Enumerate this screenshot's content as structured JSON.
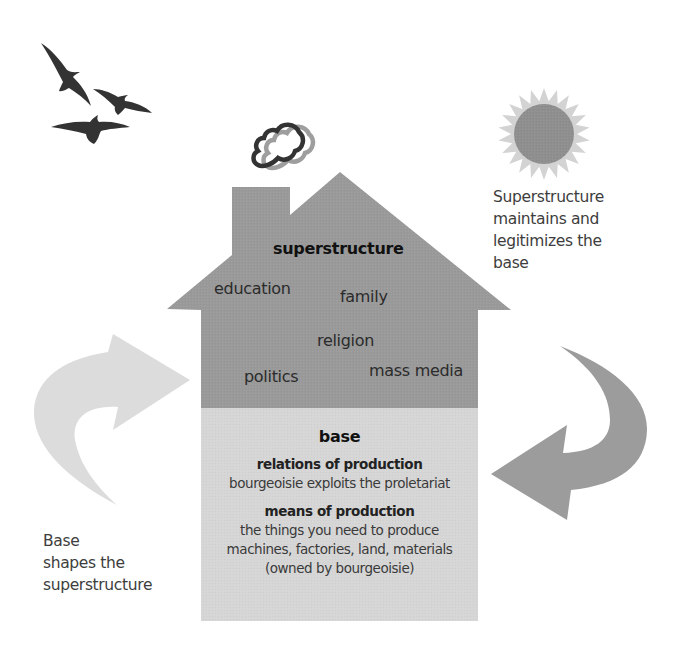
{
  "colors": {
    "superstructure_fill": "#9a9a9a",
    "base_fill": "#d6d6d6",
    "left_arrow_fill": "#dcdcdc",
    "right_arrow_fill": "#9c9c9c",
    "sun_disk": "#8f8f8f",
    "sun_rays": "#d3d3d3",
    "bird_fill": "#333333",
    "smoke_dark": "#333333",
    "smoke_light": "#9a9a9a"
  },
  "icons": {
    "birds": "birds-icon",
    "sun": "sun-icon",
    "smoke": "chimney-smoke-icon",
    "left_arrow": "curved-arrow-up-right-icon",
    "right_arrow": "curved-arrow-down-left-icon"
  },
  "superstructure": {
    "title": "superstructure",
    "institutions": {
      "education": "education",
      "family": "family",
      "religion": "religion",
      "politics": "politics",
      "mass_media": "mass media"
    }
  },
  "base": {
    "title": "base",
    "relations": {
      "heading": "relations of production",
      "description": "bourgeoisie exploits the proletariat"
    },
    "means": {
      "heading": "means of production",
      "lines": [
        "the things you need to produce",
        "machines, factories, land, materials",
        "(owned by bourgeoisie)"
      ]
    }
  },
  "annotations": {
    "right": [
      "Superstructure",
      "maintains and",
      "legitimizes the",
      "base"
    ],
    "left": [
      "Base",
      "shapes the",
      "superstructure"
    ]
  }
}
